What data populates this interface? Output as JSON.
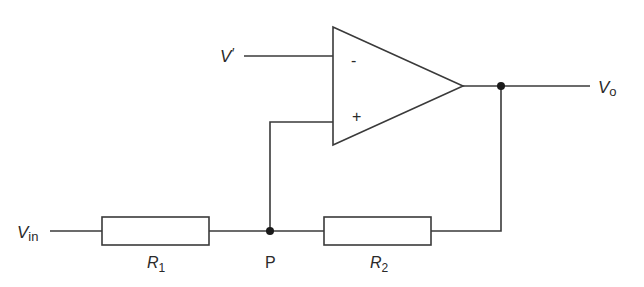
{
  "diagram": {
    "type": "circuit",
    "colors": {
      "line": "#3a3a3a",
      "background": "#ffffff",
      "node": "#1a1a1a"
    },
    "labels": {
      "v_ref_main": "V",
      "v_ref_prime": "′",
      "v_out_main": "V",
      "v_out_sub": "o",
      "v_in_main": "V",
      "v_in_sub": "in",
      "r1_main": "R",
      "r1_sub": "1",
      "r2_main": "R",
      "r2_sub": "2",
      "node_p": "P",
      "minus": "-",
      "plus": "+"
    },
    "components": [
      {
        "id": "op-amp",
        "kind": "operational amplifier",
        "inputs": [
          "-",
          "+"
        ]
      },
      {
        "id": "R1",
        "kind": "resistor",
        "between": [
          "Vin",
          "P"
        ]
      },
      {
        "id": "R2",
        "kind": "resistor",
        "between": [
          "P",
          "Vo"
        ]
      }
    ],
    "nodes": [
      "P",
      "Vo"
    ]
  }
}
